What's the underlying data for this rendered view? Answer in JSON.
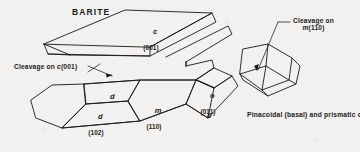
{
  "figure": {
    "title": "BARITE",
    "caption": "Pinacoidal (basal) and prismatic cleavages in barite.",
    "background_color": "#f2f1ef",
    "line_color": "#1a1a1a"
  },
  "annotations": {
    "cleavage_c": {
      "line1": "Cleavage on ",
      "form": "c",
      "indices": "(001)"
    },
    "cleavage_m": {
      "line1": "Cleavage on",
      "form": "m",
      "indices": "(110)"
    }
  },
  "face_labels": [
    {
      "form": "c",
      "indices": "(001)",
      "name": "face-label-c-001"
    },
    {
      "form": "d",
      "indices": "",
      "name": "face-label-d-upper"
    },
    {
      "form": "d",
      "indices": "(102)",
      "name": "face-label-d-102"
    },
    {
      "form": "m",
      "indices": "(110)",
      "name": "face-label-m-110"
    },
    {
      "form": "o",
      "indices": "(011)",
      "name": "face-label-o-011"
    },
    {
      "form": "o",
      "indices": "",
      "name": "face-label-o-lower"
    }
  ]
}
